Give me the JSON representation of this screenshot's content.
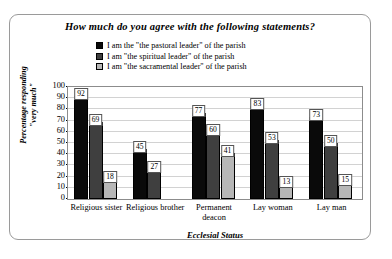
{
  "chart_data": {
    "type": "bar",
    "title": "How much do you agree with the following statements?",
    "xlabel": "Ecclesial Status",
    "ylabel": "Percentage responding \"very much\"",
    "ylim": [
      0,
      100
    ],
    "yticks": [
      0,
      10,
      20,
      30,
      40,
      50,
      60,
      70,
      80,
      90,
      100
    ],
    "grid": true,
    "legend_position": "top-center",
    "categories": [
      "Religious sister",
      "Religious brother",
      "Permanent deacon",
      "Lay woman",
      "Lay man"
    ],
    "series": [
      {
        "name": "I am the \"the pastoral leader\" of the parish",
        "color": "#0a0a0a",
        "values": [
          92,
          45,
          77,
          83,
          73
        ]
      },
      {
        "name": "I am \"the spiritual leader\" of the parish",
        "color": "#3f3f3f",
        "values": [
          69,
          27,
          60,
          53,
          50
        ]
      },
      {
        "name": "I am \"the sacramental leader\" of the parish",
        "color": "#b7b7b7",
        "values": [
          18,
          null,
          41,
          13,
          15
        ]
      }
    ]
  }
}
